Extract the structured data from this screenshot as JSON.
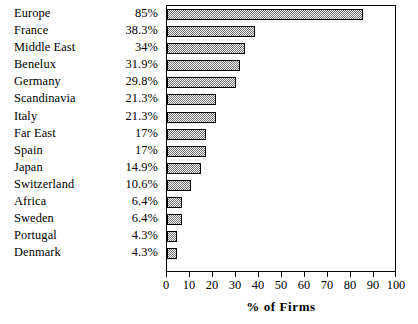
{
  "chart_data": {
    "type": "bar",
    "orientation": "horizontal",
    "title": "",
    "subtitle": "",
    "xlabel": "% of Firms",
    "ylabel": "",
    "xlim": [
      0,
      100
    ],
    "xticks": [
      0,
      10,
      20,
      30,
      40,
      50,
      60,
      70,
      80,
      90,
      100
    ],
    "xtick_labels": [
      "0",
      "10",
      "20",
      "30",
      "40",
      "50",
      "60",
      "70",
      "80",
      "90",
      "100"
    ],
    "grid": false,
    "legend": false,
    "legend_position": "none",
    "categories": [
      "Europe",
      "France",
      "Middle East",
      "Benelux",
      "Germany",
      "Scandinavia",
      "Italy",
      "Far East",
      "Spain",
      "Japan",
      "Switzerland",
      "Africa",
      "Sweden",
      "Portugal",
      "Denmark"
    ],
    "values": [
      85,
      38.3,
      34,
      31.9,
      29.8,
      21.3,
      21.3,
      17,
      17,
      14.9,
      10.6,
      6.4,
      6.4,
      4.3,
      4.3
    ],
    "value_labels": [
      "85%",
      "38.3%",
      "34%",
      "31.9%",
      "29.8%",
      "21.3%",
      "21.3%",
      "17%",
      "17%",
      "14.9%",
      "10.6%",
      "6.4%",
      "6.4%",
      "4.3%",
      "4.3%"
    ],
    "series": [
      {
        "name": "% of Firms",
        "values": [
          85,
          38.3,
          34,
          31.9,
          29.8,
          21.3,
          21.3,
          17,
          17,
          14.9,
          10.6,
          6.4,
          6.4,
          4.3,
          4.3
        ]
      }
    ],
    "colors": {
      "bar_fill": "#6e6e6e",
      "bar_fill_background": "#ffffff",
      "bar_border": "#000000",
      "axis": "#000000",
      "text": "#000000",
      "background": "#ffffff"
    }
  }
}
